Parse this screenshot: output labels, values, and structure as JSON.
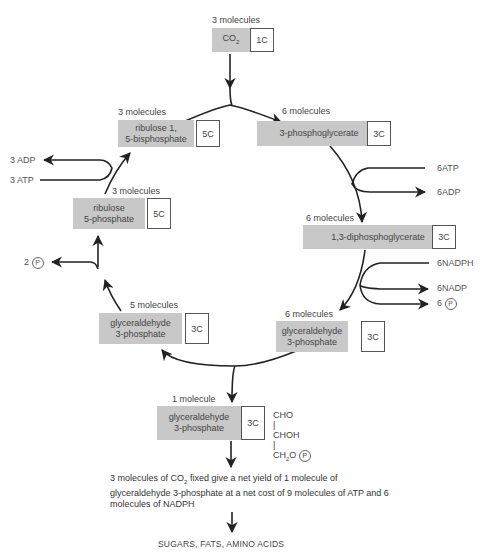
{
  "diagram": {
    "co2": {
      "count": "3 molecules",
      "name": "CO",
      "sub": "2",
      "carbons": "1C"
    },
    "nodes": [
      {
        "id": "rubp",
        "count": "3 molecules",
        "line1": "ribulose 1,",
        "line2": "5-bisphosphate",
        "carbons": "5C"
      },
      {
        "id": "pga",
        "count": "6 molecules",
        "line1": "3-phosphoglycerate",
        "line2": "",
        "carbons": "3C"
      },
      {
        "id": "dpg",
        "count": "6 molecules",
        "line1": "1,3-diphosphoglycerate",
        "line2": "",
        "carbons": "3C"
      },
      {
        "id": "g3p_right",
        "count": "6 molecules",
        "line1": "glyceraldehyde",
        "line2": "3-phosphate",
        "carbons": "3C"
      },
      {
        "id": "g3p_left",
        "count": "5 molecules",
        "line1": "glyceraldehyde",
        "line2": "3-phosphate",
        "carbons": "3C"
      },
      {
        "id": "r5p",
        "count": "3 molecules",
        "line1": "ribulose",
        "line2": "5-phosphate",
        "carbons": "5C"
      },
      {
        "id": "g3p_out",
        "count": "1 molecule",
        "line1": "glyceraldehyde",
        "line2": "3-phosphate",
        "carbons": "3C"
      }
    ],
    "side_inputs": {
      "atp_in_right": "6ATP",
      "adp_out_right": "6ADP",
      "nadph_in": "6NADPH",
      "nadp_out": "6NADP",
      "pi_out_right_count": "6",
      "pi_symbol": "P",
      "adp_out_left": "3 ADP",
      "atp_in_left": "3 ATP",
      "pi_out_left_count": "2"
    },
    "structure": {
      "l1": "CHO",
      "bar": "|",
      "l2": "CHOH",
      "l3a": "CH",
      "l3sub": "2",
      "l3b": "O"
    },
    "note": {
      "part1": "3 molecules of CO",
      "sub": "2",
      "part2": " fixed give a net yield of 1 molecule of glyceraldehyde 3-phosphate at a net cost of 9 molecules of ATP and 6 molecules of NADPH"
    },
    "final": "SUGARS, FATS, AMINO ACIDS"
  }
}
